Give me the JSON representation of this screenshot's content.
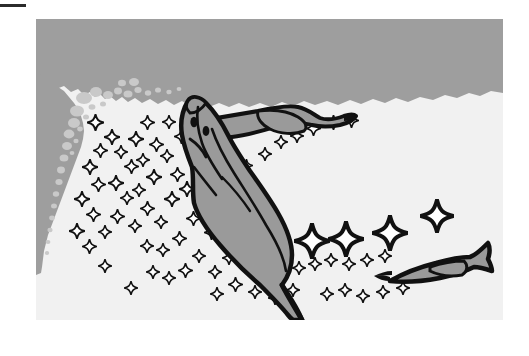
{
  "page": {
    "background_color": "#ffffff",
    "width": 529,
    "height": 356
  },
  "crop_rule": {
    "label": "scale-bar-rule",
    "color": "#2b2b2b",
    "x": 0,
    "y": 4,
    "width": 26,
    "height": 3
  },
  "figure": {
    "title": "Fish larvae feeding on plankton near a substrate edge",
    "caption": "",
    "x": 36,
    "y": 19,
    "width": 467,
    "height": 301,
    "colors": {
      "water_light": "#f1f1f1",
      "substrate_gray": "#9e9e9e",
      "body_fill": "#9a9a9a",
      "outline": "#111111",
      "bubble_gray": "#c9c9c9",
      "plankton_fill": "#ffffff"
    },
    "regions": [
      {
        "name": "upper-substrate-band",
        "description": "Dark gray band across the top of the frame with an irregular wavy lower boundary",
        "fill": "#9e9e9e"
      },
      {
        "name": "left-substrate-column",
        "description": "Gray column down the left edge with a bubbly dotted boundary",
        "fill": "#9e9e9e"
      },
      {
        "name": "open-water",
        "description": "Light field occupying the lower and central portion of the frame",
        "fill": "#f1f1f1"
      }
    ],
    "organisms": [
      {
        "name": "large-fish-larva",
        "description": "Large fish larva oriented head-up at upper-left, body tapering down and right into a long thin tail",
        "features": [
          "head",
          "two eyes",
          "gill outline",
          "elongate body",
          "thin caudal tail"
        ],
        "fill": "#9a9a9a",
        "outline": "#111111"
      },
      {
        "name": "upper-fish-larva",
        "description": "Smaller fish larva swimming horizontally to the right near the top of the frame",
        "features": [
          "slender body",
          "pointed snout",
          "gray trunk"
        ],
        "fill": "#9a9a9a",
        "outline": "#111111"
      },
      {
        "name": "right-fish-larva",
        "description": "Smaller fish larva at lower right swimming left, tail fin to the right",
        "features": [
          "slender body",
          "forked tail",
          "gray trunk"
        ],
        "fill": "#9a9a9a",
        "outline": "#111111"
      }
    ],
    "plankton": {
      "name": "four-pointed-star-plankton",
      "description": "Outlined four-pointed star shapes representing plankton prey items, small in the left cluster and larger near the right-hand larva",
      "fill": "#ffffff",
      "outline": "#111111",
      "small_count": 62,
      "large_count": 5
    }
  }
}
